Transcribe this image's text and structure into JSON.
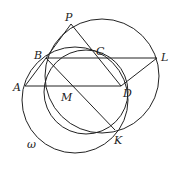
{
  "diagram": {
    "type": "geometry",
    "stroke_color": "#222222",
    "background": "#ffffff",
    "points": {
      "A": {
        "x": 25,
        "y": 86,
        "label": "A",
        "lx": 13,
        "ly": 91
      },
      "B": {
        "x": 46,
        "y": 58,
        "label": "B",
        "lx": 34,
        "ly": 59
      },
      "P": {
        "x": 71,
        "y": 24,
        "label": "P",
        "lx": 65,
        "ly": 21
      },
      "C": {
        "x": 99,
        "y": 58,
        "label": "C",
        "lx": 96,
        "ly": 55
      },
      "L": {
        "x": 157,
        "y": 58,
        "label": "L",
        "lx": 161,
        "ly": 61
      },
      "M": {
        "x": 75,
        "y": 86,
        "label": "M",
        "lx": 61,
        "ly": 101
      },
      "D": {
        "x": 121,
        "y": 86,
        "label": "D",
        "lx": 123,
        "ly": 97
      },
      "K": {
        "x": 115,
        "y": 130,
        "label": "K",
        "lx": 114,
        "ly": 144
      }
    },
    "circles": [
      {
        "name": "omega",
        "label": "ω",
        "cx": 75,
        "cy": 100,
        "r": 53,
        "lx": 27,
        "ly": 148
      },
      {
        "name": "circle-bcd",
        "cx": 86,
        "cy": 92,
        "r": 42
      },
      {
        "name": "circle-plk",
        "cx": 102,
        "cy": 76,
        "r": 57
      }
    ],
    "segments": [
      [
        "A",
        "D"
      ],
      [
        "B",
        "L"
      ],
      [
        "B",
        "K"
      ],
      [
        "P",
        "D"
      ],
      [
        "D",
        "L"
      ],
      [
        "A",
        "B"
      ],
      [
        "B",
        "P"
      ]
    ]
  }
}
